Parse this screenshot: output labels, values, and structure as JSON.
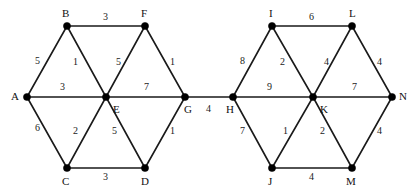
{
  "diagram": {
    "type": "weighted-undirected-graph",
    "width": 419,
    "height": 193,
    "background_color": "#ffffff",
    "edge_color": "#1a1a1a",
    "vertex_color": "#000000",
    "label_color": "#111111"
  },
  "vertices": [
    {
      "id": "A",
      "label": "A",
      "x": 27,
      "y": 97,
      "label_x": 11,
      "label_y": 91
    },
    {
      "id": "B",
      "label": "B",
      "x": 67,
      "y": 26,
      "label_x": 62,
      "label_y": 8
    },
    {
      "id": "C",
      "label": "C",
      "x": 67,
      "y": 168,
      "label_x": 62,
      "label_y": 176
    },
    {
      "id": "D",
      "label": "D",
      "x": 145,
      "y": 168,
      "label_x": 141,
      "label_y": 176
    },
    {
      "id": "E",
      "label": "E",
      "x": 106,
      "y": 97,
      "label_x": 113,
      "label_y": 104
    },
    {
      "id": "F",
      "label": "F",
      "x": 145,
      "y": 26,
      "label_x": 141,
      "label_y": 8
    },
    {
      "id": "G",
      "label": "G",
      "x": 185,
      "y": 97,
      "label_x": 184,
      "label_y": 104
    },
    {
      "id": "H",
      "label": "H",
      "x": 233,
      "y": 97,
      "label_x": 226,
      "label_y": 104
    },
    {
      "id": "I",
      "label": "I",
      "x": 272,
      "y": 26,
      "label_x": 269,
      "label_y": 8
    },
    {
      "id": "J",
      "label": "J",
      "x": 272,
      "y": 168,
      "label_x": 268,
      "label_y": 176
    },
    {
      "id": "K",
      "label": "K",
      "x": 313,
      "y": 97,
      "label_x": 320,
      "label_y": 104
    },
    {
      "id": "L",
      "label": "L",
      "x": 352,
      "y": 26,
      "label_x": 349,
      "label_y": 8
    },
    {
      "id": "M",
      "label": "M",
      "x": 352,
      "y": 168,
      "label_x": 346,
      "label_y": 176
    },
    {
      "id": "N",
      "label": "N",
      "x": 392,
      "y": 97,
      "label_x": 399,
      "label_y": 91
    }
  ],
  "edges": [
    {
      "from": "A",
      "to": "B",
      "weight": "5",
      "label_x": 35,
      "label_y": 56
    },
    {
      "from": "A",
      "to": "C",
      "weight": "6",
      "label_x": 35,
      "label_y": 123
    },
    {
      "from": "A",
      "to": "E",
      "weight": "3",
      "label_x": 60,
      "label_y": 82
    },
    {
      "from": "B",
      "to": "F",
      "weight": "3",
      "label_x": 103,
      "label_y": 12
    },
    {
      "from": "B",
      "to": "E",
      "weight": "1",
      "label_x": 73,
      "label_y": 57
    },
    {
      "from": "E",
      "to": "F",
      "weight": "5",
      "label_x": 116,
      "label_y": 57
    },
    {
      "from": "F",
      "to": "G",
      "weight": "1",
      "label_x": 170,
      "label_y": 57
    },
    {
      "from": "E",
      "to": "G",
      "weight": "7",
      "label_x": 144,
      "label_y": 82
    },
    {
      "from": "C",
      "to": "E",
      "weight": "2",
      "label_x": 73,
      "label_y": 126
    },
    {
      "from": "E",
      "to": "D",
      "weight": "5",
      "label_x": 112,
      "label_y": 126
    },
    {
      "from": "C",
      "to": "D",
      "weight": "3",
      "label_x": 103,
      "label_y": 172
    },
    {
      "from": "D",
      "to": "G",
      "weight": "1",
      "label_x": 170,
      "label_y": 126
    },
    {
      "from": "G",
      "to": "H",
      "weight": "4",
      "label_x": 206,
      "label_y": 104
    },
    {
      "from": "H",
      "to": "I",
      "weight": "8",
      "label_x": 240,
      "label_y": 56
    },
    {
      "from": "H",
      "to": "J",
      "weight": "7",
      "label_x": 240,
      "label_y": 126
    },
    {
      "from": "H",
      "to": "K",
      "weight": "9",
      "label_x": 267,
      "label_y": 82
    },
    {
      "from": "I",
      "to": "L",
      "weight": "6",
      "label_x": 309,
      "label_y": 12
    },
    {
      "from": "I",
      "to": "K",
      "weight": "2",
      "label_x": 280,
      "label_y": 57
    },
    {
      "from": "K",
      "to": "L",
      "weight": "4",
      "label_x": 324,
      "label_y": 57
    },
    {
      "from": "L",
      "to": "N",
      "weight": "4",
      "label_x": 377,
      "label_y": 57
    },
    {
      "from": "K",
      "to": "N",
      "weight": "7",
      "label_x": 352,
      "label_y": 82
    },
    {
      "from": "J",
      "to": "K",
      "weight": "1",
      "label_x": 283,
      "label_y": 126
    },
    {
      "from": "K",
      "to": "M",
      "weight": "2",
      "label_x": 320,
      "label_y": 126
    },
    {
      "from": "J",
      "to": "M",
      "weight": "4",
      "label_x": 309,
      "label_y": 172
    },
    {
      "from": "M",
      "to": "N",
      "weight": "4",
      "label_x": 377,
      "label_y": 126
    }
  ]
}
